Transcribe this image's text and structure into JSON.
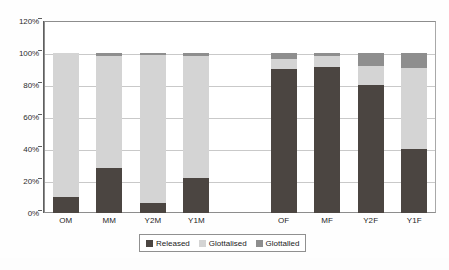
{
  "chart_data": {
    "type": "bar",
    "subtype": "stacked-percentage",
    "title": "",
    "xlabel": "",
    "ylabel": "",
    "ylim": [
      0,
      120
    ],
    "yticks": [
      "0%",
      "20%",
      "40%",
      "60%",
      "80%",
      "100%",
      "120%"
    ],
    "ytick_values": [
      0,
      20,
      40,
      60,
      80,
      100,
      120
    ],
    "grid": true,
    "grid_axis": "y",
    "legend_position": "bottom",
    "categories": [
      "OM",
      "MM",
      "Y2M",
      "Y1M",
      "OF",
      "MF",
      "Y2F",
      "Y1F"
    ],
    "series": [
      {
        "name": "Released",
        "color": "#4b4541",
        "values": [
          10,
          28,
          6,
          22,
          90,
          91.5,
          80,
          40
        ]
      },
      {
        "name": "Glottalised",
        "color": "#d4d4d4",
        "values": [
          90,
          70,
          93,
          76,
          6,
          6.5,
          12,
          50.5
        ]
      },
      {
        "name": "Glottalled",
        "color": "#8e8e8e",
        "values": [
          0,
          2,
          1,
          2,
          4,
          2,
          8,
          9.5
        ]
      }
    ],
    "group_gap_after_index": 3
  },
  "legend": {
    "items": [
      {
        "label": "Released",
        "color": "#4b4541"
      },
      {
        "label": "Glottalised",
        "color": "#d4d4d4"
      },
      {
        "label": "Glottalled",
        "color": "#8e8e8e"
      }
    ]
  },
  "axes": {
    "y": {
      "ticks": [
        "0%",
        "20%",
        "40%",
        "60%",
        "80%",
        "100%",
        "120%"
      ]
    },
    "x": {
      "ticks": [
        "OM",
        "MM",
        "Y2M",
        "Y1M",
        "OF",
        "MF",
        "Y2F",
        "Y1F"
      ]
    }
  },
  "colors": {
    "released": "#4b4541",
    "glottalised": "#d4d4d4",
    "glottalled": "#8e8e8e",
    "grid": "#c9c9c9",
    "axis": "#5f5f5f",
    "text": "#1f1f1f"
  }
}
